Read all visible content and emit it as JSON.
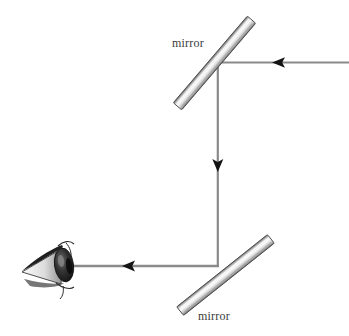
{
  "figure": {
    "width": 349,
    "height": 336,
    "background_color": "#ffffff"
  },
  "labels": {
    "mirror_top": "mirror",
    "mirror_bottom": "mirror"
  },
  "colors": {
    "ray": "#8a8a8a",
    "arrow": "#1a1a1a",
    "mirror_edge": "#58585a",
    "mirror_light": "#f2f2f2",
    "mirror_mid": "#c9c9c9",
    "eye_dark": "#1d1d1d",
    "eye_mid": "#6e6e6e",
    "eye_light": "#d8d8d8",
    "label_text": "#3b3b3b"
  },
  "elements": {
    "mirror_top": {
      "name": "mirror",
      "orientation": "45deg-down-left-to-up-right",
      "from": [
        178,
        106
      ],
      "to": [
        251,
        20
      ],
      "thickness": 11
    },
    "mirror_bottom": {
      "name": "mirror",
      "orientation": "45deg-down-left-to-up-right",
      "from": [
        180,
        311
      ],
      "to": [
        271,
        239
      ],
      "thickness": 11
    },
    "eye": {
      "name": "eye",
      "position": [
        58,
        264
      ]
    }
  },
  "rays": [
    {
      "name": "incoming-ray-top",
      "from": [
        349,
        62
      ],
      "to": [
        218,
        62
      ],
      "direction": "left",
      "arrow_at": [
        285,
        62
      ]
    },
    {
      "name": "vertical-ray",
      "from": [
        218,
        62
      ],
      "to": [
        218,
        266
      ],
      "direction": "down",
      "arrow_at": [
        218,
        164
      ]
    },
    {
      "name": "outgoing-ray-to-eye",
      "from": [
        219,
        266
      ],
      "to": [
        70,
        266
      ],
      "direction": "left",
      "arrow_at": [
        134,
        266
      ]
    }
  ]
}
